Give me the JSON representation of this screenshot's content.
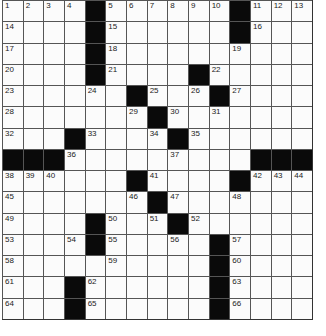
{
  "puzzle": {
    "rows": 15,
    "cols": 15,
    "grid": [
      [
        "1",
        "2",
        "3",
        "4",
        "#",
        "5",
        "6",
        "7",
        "8",
        "9",
        "10",
        "#",
        "11",
        "12",
        "13"
      ],
      [
        "14",
        "",
        "",
        "",
        "#",
        "15",
        "",
        "",
        "",
        "",
        "",
        "#",
        "16",
        "",
        ""
      ],
      [
        "17",
        "",
        "",
        "",
        "#",
        "18",
        "",
        "",
        "",
        "",
        "",
        "19",
        "",
        "",
        ""
      ],
      [
        "20",
        "",
        "",
        "",
        "#",
        "21",
        "",
        "",
        "",
        "#",
        "22",
        "",
        "",
        "",
        ""
      ],
      [
        "23",
        "",
        "",
        "",
        "24",
        "",
        "#",
        "25",
        "",
        "26",
        "#",
        "27",
        "",
        "",
        ""
      ],
      [
        "28",
        "",
        "",
        "",
        "",
        "",
        "29",
        "#",
        "30",
        "",
        "31",
        "",
        "",
        "",
        ""
      ],
      [
        "32",
        "",
        "",
        "#",
        "33",
        "",
        "",
        "34",
        "#",
        "35",
        "",
        "",
        "",
        "",
        ""
      ],
      [
        "#",
        "#",
        "#",
        "36",
        "",
        "",
        "",
        "",
        "37",
        "",
        "",
        "",
        "#",
        "#",
        "#"
      ],
      [
        "38",
        "39",
        "40",
        "",
        "",
        "",
        "#",
        "41",
        "",
        "",
        "",
        "#",
        "42",
        "43",
        "44"
      ],
      [
        "45",
        "",
        "",
        "",
        "",
        "",
        "46",
        "#",
        "47",
        "",
        "",
        "48",
        "",
        "",
        ""
      ],
      [
        "49",
        "",
        "",
        "",
        "#",
        "50",
        "",
        "51",
        "#",
        "52",
        "",
        "",
        "",
        "",
        ""
      ],
      [
        "53",
        "",
        "",
        "54",
        "#",
        "55",
        "",
        "",
        "56",
        "",
        "#",
        "57",
        "",
        "",
        ""
      ],
      [
        "58",
        "",
        "",
        "",
        "",
        "59",
        "",
        "",
        "",
        "",
        "#",
        "60",
        "",
        "",
        ""
      ],
      [
        "61",
        "",
        "",
        "#",
        "62",
        "",
        "",
        "",
        "",
        "",
        "#",
        "63",
        "",
        "",
        ""
      ],
      [
        "64",
        "",
        "",
        "#",
        "65",
        "",
        "",
        "",
        "",
        "",
        "#",
        "66",
        "",
        "",
        ""
      ]
    ]
  }
}
